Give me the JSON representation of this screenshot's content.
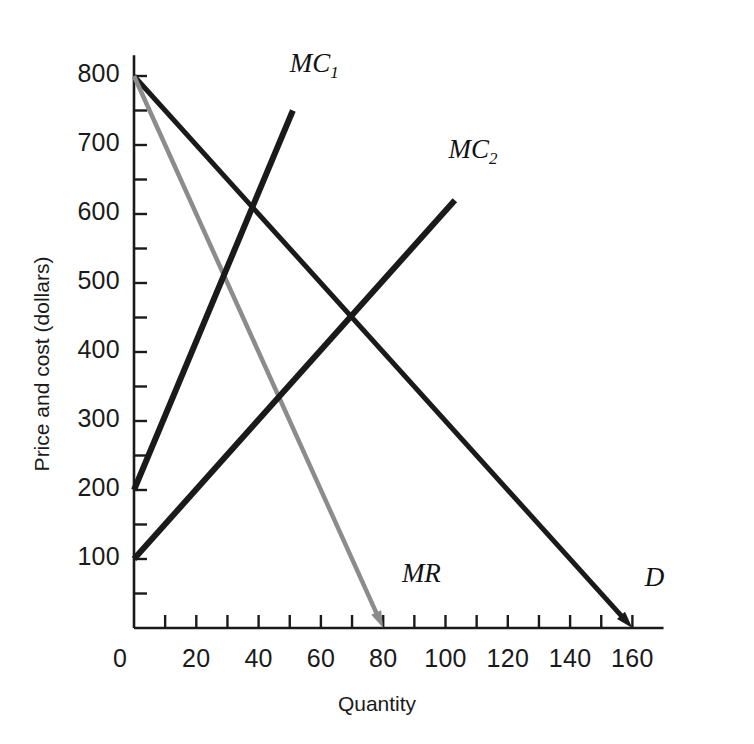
{
  "chart_data": {
    "type": "line",
    "title": "",
    "xlabel": "Quantity",
    "ylabel": "Price and cost (dollars)",
    "xlim": [
      0,
      170
    ],
    "ylim": [
      0,
      830
    ],
    "grid": false,
    "legend": "inline-labels",
    "x_ticks_major": [
      0,
      20,
      40,
      60,
      80,
      100,
      120,
      140,
      160
    ],
    "x_tick_labels": [
      "0",
      "20",
      "40",
      "60",
      "80",
      "100",
      "120",
      "140",
      "160"
    ],
    "x_ticks_minor": [
      10,
      30,
      50,
      70,
      90,
      110,
      130,
      150
    ],
    "y_ticks_major": [
      100,
      200,
      300,
      400,
      500,
      600,
      700,
      800
    ],
    "y_tick_labels": [
      "100",
      "200",
      "300",
      "400",
      "500",
      "600",
      "700",
      "800"
    ],
    "y_ticks_minor": [
      50,
      150,
      250,
      350,
      450,
      550,
      650,
      750
    ],
    "series": [
      {
        "name": "D",
        "label": "D",
        "color": "#1a1a1a",
        "width": 5,
        "arrow_end": true,
        "points": [
          [
            0,
            800
          ],
          [
            160,
            0
          ]
        ],
        "label_x": 164,
        "label_y": 70
      },
      {
        "name": "MR",
        "label": "MR",
        "color": "#8c8c8c",
        "width": 4.5,
        "arrow_end": true,
        "points": [
          [
            0,
            800
          ],
          [
            80,
            0
          ]
        ],
        "label_x": 86,
        "label_y": 75
      },
      {
        "name": "MC1",
        "label": "MC",
        "sub": "1",
        "color": "#1a1a1a",
        "width": 6,
        "arrow_end": false,
        "points": [
          [
            0,
            200
          ],
          [
            51,
            750
          ]
        ],
        "label_x": 50,
        "label_y": 815
      },
      {
        "name": "MC2",
        "label": "MC",
        "sub": "2",
        "color": "#1a1a1a",
        "width": 6,
        "arrow_end": false,
        "points": [
          [
            0,
            100
          ],
          [
            103,
            620
          ]
        ],
        "label_x": 101,
        "label_y": 690
      }
    ],
    "intersections": [
      {
        "curves": [
          "MC1",
          "D"
        ],
        "x": 38,
        "y": 610
      },
      {
        "curves": [
          "MC1",
          "MR"
        ],
        "x": 30,
        "y": 510
      },
      {
        "curves": [
          "MC2",
          "D"
        ],
        "x": 70,
        "y": 450
      },
      {
        "curves": [
          "MC2",
          "MR"
        ],
        "x": 47,
        "y": 335
      }
    ]
  },
  "axes": {
    "x_title": "Quantity",
    "y_title": "Price and cost (dollars)",
    "axis_color": "#1a1a1a"
  }
}
